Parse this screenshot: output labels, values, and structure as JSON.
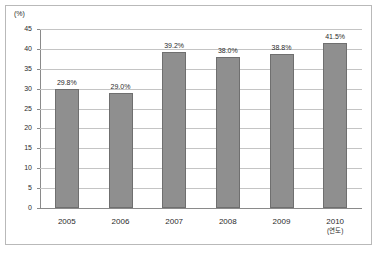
{
  "chart_data": {
    "type": "bar",
    "title": "",
    "subtitle": "",
    "xlabel": "(연도)",
    "ylabel": "(%)",
    "categories": [
      "2005",
      "2006",
      "2007",
      "2008",
      "2009",
      "2010"
    ],
    "values": [
      29.8,
      29.0,
      39.2,
      38.0,
      38.8,
      41.5
    ],
    "data_labels": [
      "29.8%",
      "29.0%",
      "39.2%",
      "38.0%",
      "38.8%",
      "41.5%"
    ],
    "ylim": [
      0,
      45
    ],
    "ytick_step": 5,
    "yticks": [
      "0",
      "5",
      "10",
      "15",
      "20",
      "25",
      "30",
      "35",
      "40",
      "45"
    ],
    "grid": true,
    "grid_axis": "y",
    "legend": false,
    "legend_position": "none",
    "bar_color": "#8f8f8f",
    "bar_border_color": "#6f6f6f",
    "gridline_color": "#c4c4c4",
    "axis_color": "#8a8a8a",
    "frame_color": "#b9b9b9",
    "text_color": "#2b2b2b",
    "background_color": "#ffffff"
  }
}
